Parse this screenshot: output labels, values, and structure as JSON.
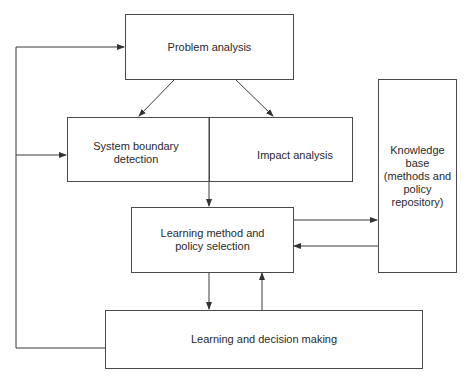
{
  "diagram": {
    "nodes": {
      "problem_analysis": "Problem analysis",
      "system_boundary": "System boundary detection",
      "impact_analysis": "Impact analysis",
      "knowledge_base": "Knowledge base (methods and policy repository)",
      "learning_method": "Learning method and policy selection",
      "learning_decision": "Learning and decision making"
    },
    "labels": {
      "system_boundary_l1": "System boundary",
      "system_boundary_l2": "detection",
      "kb_l1": "Knowledge",
      "kb_l2": "base",
      "kb_l3": "(methods and",
      "kb_l4": "policy",
      "kb_l5": "repository)",
      "lm_l1": "Learning method and",
      "lm_l2": "policy selection"
    },
    "edges": [
      {
        "from": "problem_analysis",
        "to": "system_boundary"
      },
      {
        "from": "problem_analysis",
        "to": "impact_analysis"
      },
      {
        "from": "system_boundary",
        "to": "learning_method"
      },
      {
        "from": "learning_method",
        "to": "knowledge_base"
      },
      {
        "from": "knowledge_base",
        "to": "learning_method"
      },
      {
        "from": "learning_method",
        "to": "learning_decision"
      },
      {
        "from": "learning_decision",
        "to": "learning_method"
      },
      {
        "from": "learning_decision",
        "to": "problem_analysis"
      },
      {
        "from": "learning_decision",
        "to": "system_boundary"
      }
    ],
    "colors": {
      "line": "#3a3a3a",
      "background": "#ffffff"
    }
  }
}
